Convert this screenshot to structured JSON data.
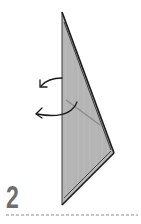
{
  "step": {
    "number": "2"
  },
  "colors": {
    "paper_fill": "#b4b4b4",
    "outline": "#1a1a1a",
    "crease": "#8a8a8a",
    "step_number": "#6e6e6e",
    "divider": "#8c8c8c"
  },
  "diagram": {
    "shape": "folded kite point (origami)",
    "arrows": [
      {
        "name": "fold-behind-arrow-upper",
        "direction": "left"
      },
      {
        "name": "fold-behind-arrow-lower",
        "direction": "left"
      }
    ]
  }
}
